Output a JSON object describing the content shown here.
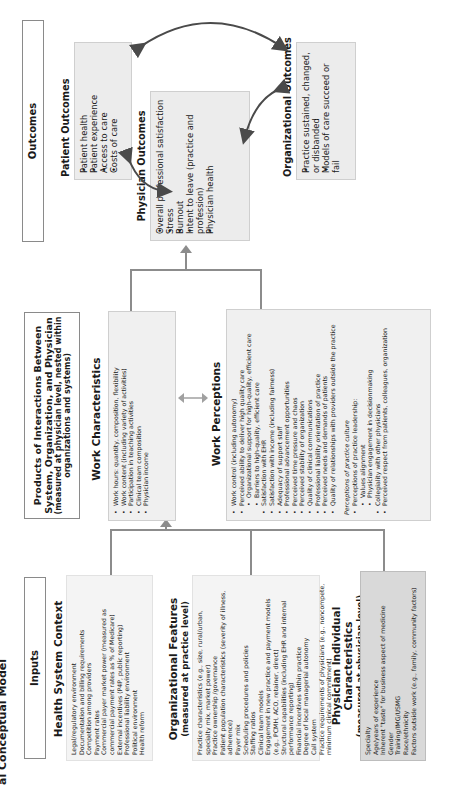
{
  "page": {
    "title_fragment": "al Conceptual Model",
    "orientation": "rotated-90-ccw"
  },
  "columns": {
    "inputs": "Inputs",
    "products": "Products of Interactions Between System, Organization, and Physician",
    "products_sub": "(measured at physician level, nested within organizations and systems)",
    "outcomes": "Outcomes"
  },
  "health_system_context": {
    "title": "Health System Context",
    "items": [
      "Legal/regulatory environment",
      "Documentation and billing requirements",
      "Competition among providers",
      "Payment rates",
      "Commercial payer market power (measured as commercial payment rates as % of Medicare)",
      "External incentives (P4P, public reporting)",
      "Professional liability environment",
      "Political environment",
      "Health reform"
    ]
  },
  "organizational_features": {
    "title": "Organizational Features",
    "subtitle": "(measured at practice level)",
    "items": [
      "Practice characteristics (e.g., size, rural/urban, specialty mix, market power)",
      "Practice ownership /governance",
      "Patient population characteristics (severity of illness, adherence)",
      "Payer mix",
      "Scheduling procedures and policies",
      "Staffing ratios",
      "Clinical team models",
      "Engagement in new practice and payment models (e.g., PCMH, ACO, retainer, direct)",
      "Structural capabilities (including EHR and internal performance reporting)",
      "Financial incentives within practice",
      "Degree of local managerial autonomy",
      "Call system",
      "Practice requirements of physicians (e.g., noncompete, minimum clinical commitment)"
    ]
  },
  "physician_individual": {
    "title": "Physician Individual Characteristics",
    "subtitle": "(measured at physician level)",
    "items": [
      "Specialty",
      "Age/years of experience",
      "Inherent \"taste\" for business aspect of medicine",
      "Gender",
      "Training/IMG/USMG",
      "Race/ethnicity",
      "Factors outside work (e.g., family, community factors)"
    ]
  },
  "work_characteristics": {
    "title": "Work Characteristics",
    "items": [
      "Work hours: quantity, composition, flexibility",
      "Work content (including variety of activities)",
      "Participation in teaching activities",
      "Clinical team composition",
      "Physician income"
    ]
  },
  "work_perceptions": {
    "title": "Work Perceptions",
    "items": [
      {
        "text": "Work control (including autonomy)",
        "level": 0
      },
      {
        "text": "Perceived ability to deliver high quality care",
        "level": 0
      },
      {
        "text": "Organizational support for high-quality, efficient care",
        "level": 1
      },
      {
        "text": "Barriers to high-quality, efficient care",
        "level": 1
      },
      {
        "text": "Satisfaction with EHR",
        "level": 0
      },
      {
        "text": "Satisfaction with income (including fairness)",
        "level": 0
      },
      {
        "text": "Adequacy of support staff",
        "level": 0
      },
      {
        "text": "Professional advancement opportunities",
        "level": 0
      },
      {
        "text": "Perceived time pressure and chaos",
        "level": 0
      },
      {
        "text": "Perceived stability of organization",
        "level": 0
      },
      {
        "text": "Quality of clinical communications",
        "level": 0
      },
      {
        "text": "Professional liability orientation of practice",
        "level": 0
      },
      {
        "text": "Perceived needs and demands of patients",
        "level": 0
      },
      {
        "text": "Quality of relationships with providers outside the practice",
        "level": 0
      }
    ],
    "culture_heading": "Perceptions of practice culture",
    "culture_items": [
      {
        "text": "Perceptions of practice leadership:",
        "level": 0
      },
      {
        "text": "Values alignment",
        "level": 1
      },
      {
        "text": "Physician engagement in decisionmaking",
        "level": 1
      },
      {
        "text": "Collegiality with other physicians",
        "level": 0
      },
      {
        "text": "Perceived respect from patients, colleagues, organization",
        "level": 0
      }
    ]
  },
  "physician_outcomes": {
    "title": "Physician Outcomes",
    "items": [
      "Overall professional satisfaction",
      "Stress",
      "Burnout",
      "Intent to leave (practice and profession)",
      "Physician health"
    ]
  },
  "patient_outcomes": {
    "title": "Patient Outcomes",
    "items": [
      "Patient health",
      "Patient experience",
      "Access to care",
      "Costs of care"
    ]
  },
  "organizational_outcomes": {
    "title": "Organizational Outcomes",
    "items": [
      "Practice sustained, changed, or disbanded",
      "Models of care succeed or fail"
    ]
  },
  "colors": {
    "box_fill": "#eeeeee",
    "box_fill_dark": "#d9d9d9",
    "line": "#8c8c8c",
    "curve_arrow": "#4a4a4a"
  }
}
